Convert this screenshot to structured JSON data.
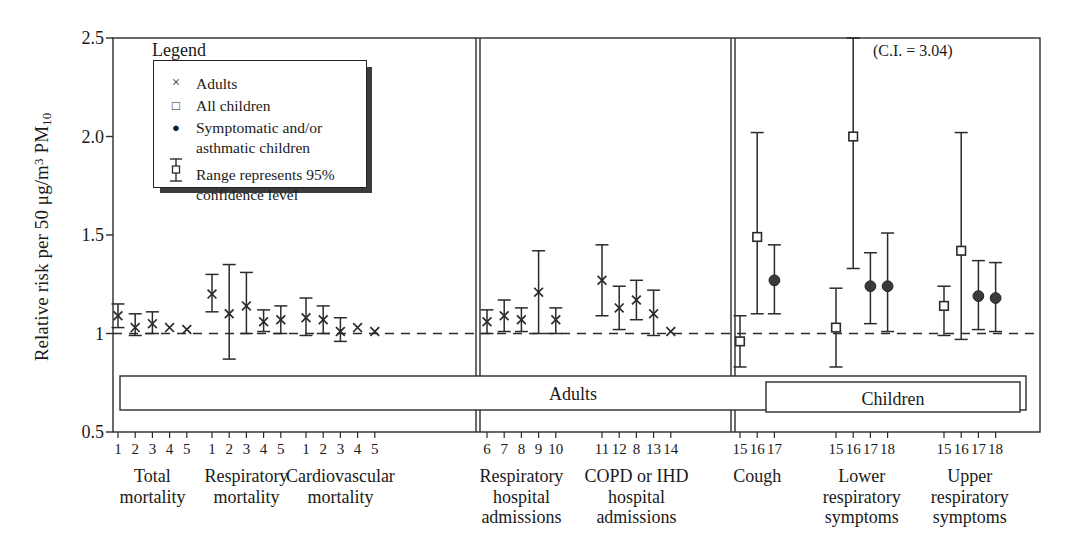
{
  "figure": {
    "ylabel_prefix": "Relative risk per 50 ",
    "ylabel_unit": "μg/m",
    "ylabel_unit_sup": "3",
    "ylabel_pollutant": " PM",
    "ylabel_pollutant_sub": "10",
    "annotation": "(C.I. = 3.04)",
    "adults_box_label": "Adults",
    "children_box_label": "Children"
  },
  "legend": {
    "title": "Legend",
    "items": [
      {
        "symbol": "×",
        "symbol_name": "cross-marker",
        "label": "Adults"
      },
      {
        "symbol": "□",
        "symbol_name": "open-square-marker",
        "label": "All children"
      },
      {
        "symbol": "●",
        "symbol_name": "filled-circle-marker",
        "label": "Symptomatic and/or"
      },
      {
        "symbol": "",
        "symbol_name": "none",
        "label": "asthmatic children"
      },
      {
        "symbol": "errorbar",
        "symbol_name": "error-bar-marker",
        "label": "Range represents 95%"
      },
      {
        "symbol": "",
        "symbol_name": "none",
        "label": "confidence level"
      }
    ]
  },
  "chart_data": {
    "type": "scatter",
    "title": "",
    "xlabel": "",
    "ylabel": "Relative risk per 50 μg/m3 PM10",
    "ylim": [
      0.5,
      2.5
    ],
    "ytick_labels": [
      "0.5",
      "1",
      "1.5",
      "2.0",
      "2.5"
    ],
    "ytick_values": [
      0.5,
      1.0,
      1.5,
      2.0,
      2.5
    ],
    "grid": false,
    "reference_line": 1.0,
    "legend_position": "upper-left",
    "section_labels": [
      "Adults",
      "Children"
    ],
    "annotations": [
      "(C.I. = 3.04)"
    ],
    "groups": [
      {
        "name": "Total mortality",
        "label_lines": [
          "Total",
          "mortality"
        ],
        "section": "Adults",
        "points": [
          {
            "study": "1",
            "series": "Adults",
            "value": 1.09,
            "lo": 1.03,
            "hi": 1.15
          },
          {
            "study": "2",
            "series": "Adults",
            "value": 1.03,
            "lo": 0.99,
            "hi": 1.1
          },
          {
            "study": "3",
            "series": "Adults",
            "value": 1.05,
            "lo": 1.0,
            "hi": 1.11
          },
          {
            "study": "4",
            "series": "Adults",
            "value": 1.03,
            "lo": null,
            "hi": null
          },
          {
            "study": "5",
            "series": "Adults",
            "value": 1.02,
            "lo": null,
            "hi": null
          }
        ]
      },
      {
        "name": "Respiratory mortality",
        "label_lines": [
          "Respiratory",
          "mortality"
        ],
        "section": "Adults",
        "points": [
          {
            "study": "1",
            "series": "Adults",
            "value": 1.2,
            "lo": 1.11,
            "hi": 1.3
          },
          {
            "study": "2",
            "series": "Adults",
            "value": 1.1,
            "lo": 0.87,
            "hi": 1.35
          },
          {
            "study": "3",
            "series": "Adults",
            "value": 1.14,
            "lo": 1.0,
            "hi": 1.31
          },
          {
            "study": "4",
            "series": "Adults",
            "value": 1.06,
            "lo": 1.01,
            "hi": 1.12
          },
          {
            "study": "5",
            "series": "Adults",
            "value": 1.07,
            "lo": 1.0,
            "hi": 1.14
          }
        ]
      },
      {
        "name": "Cardiovascular mortality",
        "label_lines": [
          "Cardiovascular",
          "mortality"
        ],
        "section": "Adults",
        "points": [
          {
            "study": "1",
            "series": "Adults",
            "value": 1.08,
            "lo": 0.99,
            "hi": 1.18
          },
          {
            "study": "2",
            "series": "Adults",
            "value": 1.07,
            "lo": 1.0,
            "hi": 1.14
          },
          {
            "study": "3",
            "series": "Adults",
            "value": 1.01,
            "lo": 0.96,
            "hi": 1.08
          },
          {
            "study": "4",
            "series": "Adults",
            "value": 1.03,
            "lo": null,
            "hi": null
          },
          {
            "study": "5",
            "series": "Adults",
            "value": 1.01,
            "lo": null,
            "hi": null
          }
        ]
      },
      {
        "name": "Respiratory hospital admissions",
        "label_lines": [
          "Respiratory",
          "hospital",
          "admissions"
        ],
        "section": "Adults",
        "points": [
          {
            "study": "6",
            "series": "Adults",
            "value": 1.06,
            "lo": 1.0,
            "hi": 1.12
          },
          {
            "study": "7",
            "series": "Adults",
            "value": 1.09,
            "lo": 1.01,
            "hi": 1.17
          },
          {
            "study": "8",
            "series": "Adults",
            "value": 1.07,
            "lo": 1.01,
            "hi": 1.13
          },
          {
            "study": "9",
            "series": "Adults",
            "value": 1.21,
            "lo": 1.0,
            "hi": 1.42
          },
          {
            "study": "10",
            "series": "Adults",
            "value": 1.07,
            "lo": 1.0,
            "hi": 1.13
          }
        ]
      },
      {
        "name": "COPD or IHD hospital admissions",
        "label_lines": [
          "COPD or IHD",
          "hospital",
          "admissions"
        ],
        "section": "Adults",
        "points": [
          {
            "study": "11",
            "series": "Adults",
            "value": 1.27,
            "lo": 1.09,
            "hi": 1.45
          },
          {
            "study": "12",
            "series": "Adults",
            "value": 1.13,
            "lo": 1.02,
            "hi": 1.24
          },
          {
            "study": "8",
            "series": "Adults",
            "value": 1.17,
            "lo": 1.07,
            "hi": 1.27
          },
          {
            "study": "13",
            "series": "Adults",
            "value": 1.1,
            "lo": 0.99,
            "hi": 1.22
          },
          {
            "study": "14",
            "series": "Adults",
            "value": 1.01,
            "lo": null,
            "hi": null
          }
        ]
      },
      {
        "name": "Cough",
        "label_lines": [
          "Cough"
        ],
        "section": "Children",
        "points": [
          {
            "study": "15",
            "series": "All children",
            "value": 0.96,
            "lo": 0.83,
            "hi": 1.09
          },
          {
            "study": "16",
            "series": "All children",
            "value": 1.49,
            "lo": 1.1,
            "hi": 2.02
          },
          {
            "study": "17",
            "series": "Symptomatic and/or asthmatic children",
            "value": 1.27,
            "lo": 1.1,
            "hi": 1.45
          }
        ]
      },
      {
        "name": "Lower respiratory symptoms",
        "label_lines": [
          "Lower",
          "respiratory",
          "symptoms"
        ],
        "section": "Children",
        "points": [
          {
            "study": "15",
            "series": "All children",
            "value": 1.03,
            "lo": 0.83,
            "hi": 1.23
          },
          {
            "study": "16",
            "series": "All children",
            "value": 2.0,
            "lo": 1.33,
            "hi": 3.04
          },
          {
            "study": "17",
            "series": "Symptomatic and/or asthmatic children",
            "value": 1.24,
            "lo": 1.05,
            "hi": 1.41
          },
          {
            "study": "18",
            "series": "Symptomatic and/or asthmatic children",
            "value": 1.24,
            "lo": 1.01,
            "hi": 1.51
          }
        ]
      },
      {
        "name": "Upper respiratory symptoms",
        "label_lines": [
          "Upper",
          "respiratory",
          "symptoms"
        ],
        "section": "Children",
        "points": [
          {
            "study": "15",
            "series": "All children",
            "value": 1.14,
            "lo": 0.99,
            "hi": 1.24
          },
          {
            "study": "16",
            "series": "All children",
            "value": 1.42,
            "lo": 0.97,
            "hi": 2.02
          },
          {
            "study": "17",
            "series": "Symptomatic and/or asthmatic children",
            "value": 1.19,
            "lo": 1.02,
            "hi": 1.37
          },
          {
            "study": "18",
            "series": "Symptomatic and/or asthmatic children",
            "value": 1.18,
            "lo": 1.01,
            "hi": 1.36
          }
        ]
      }
    ]
  }
}
